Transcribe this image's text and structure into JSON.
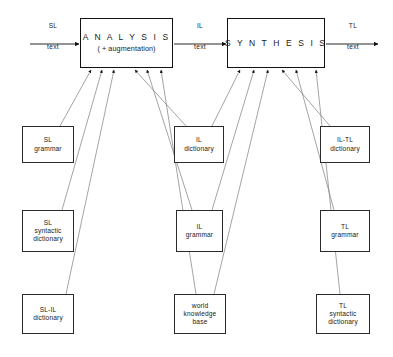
{
  "diagram": {
    "canvas": {
      "width": 393,
      "height": 357
    },
    "colors": {
      "stroke": "#2b2b2b",
      "process_stroke": "#111111",
      "background": "#ffffff",
      "text": "#1a1a1a"
    },
    "process_nodes": [
      {
        "id": "analysis",
        "line1": "A N A L Y S I S",
        "line2": "( + augmentation)",
        "x": 80,
        "y": 18,
        "w": 93,
        "h": 50
      },
      {
        "id": "synthesis",
        "line1": "S Y N T H E S I S",
        "line2": "",
        "x": 227,
        "y": 18,
        "w": 98,
        "h": 50
      }
    ],
    "flow_labels": [
      {
        "id": "sl-input",
        "top": "SL",
        "bottom": "text",
        "x": 28,
        "y": 22,
        "w": 50
      },
      {
        "id": "il-middle",
        "top": "IL",
        "bottom": "text",
        "x": 176,
        "y": 22,
        "w": 48
      },
      {
        "id": "tl-output",
        "top": "TL",
        "bottom": "text",
        "x": 330,
        "y": 22,
        "w": 46
      }
    ],
    "resource_nodes": [
      {
        "id": "sl-grammar",
        "lines": [
          "SL",
          "grammar"
        ],
        "x": 22,
        "y": 126,
        "w": 52,
        "h": 37
      },
      {
        "id": "il-dictionary",
        "lines": [
          "IL",
          "dictionary"
        ],
        "x": 174,
        "y": 126,
        "w": 50,
        "h": 37
      },
      {
        "id": "il-tl-dictionary",
        "lines": [
          "IL-TL",
          "dictionary"
        ],
        "x": 320,
        "y": 126,
        "w": 50,
        "h": 37
      },
      {
        "id": "sl-syntactic-dictionary",
        "lines": [
          "SL",
          "syntactic",
          "dictionary"
        ],
        "x": 22,
        "y": 210,
        "w": 52,
        "h": 42
      },
      {
        "id": "il-grammar",
        "lines": [
          "IL",
          "grammar"
        ],
        "x": 176,
        "y": 210,
        "w": 47,
        "h": 42
      },
      {
        "id": "tl-grammar",
        "lines": [
          "TL",
          "grammar"
        ],
        "x": 320,
        "y": 210,
        "w": 50,
        "h": 42
      },
      {
        "id": "sl-il-dictionary",
        "lines": [
          "SL-IL",
          "dictionary"
        ],
        "x": 22,
        "y": 294,
        "w": 52,
        "h": 40
      },
      {
        "id": "world-knowledge-base",
        "lines": [
          "world",
          "knowledge",
          "base"
        ],
        "x": 174,
        "y": 294,
        "w": 52,
        "h": 40
      },
      {
        "id": "tl-syntactic-dictionary",
        "lines": [
          "TL",
          "syntactic",
          "dictionary"
        ],
        "x": 316,
        "y": 294,
        "w": 54,
        "h": 40
      }
    ],
    "flow_arrows": [
      {
        "id": "sl-text-into-analysis",
        "from": [
          30,
          44
        ],
        "to": [
          79,
          44
        ]
      },
      {
        "id": "il-text-analysis-to-synthesis",
        "from": [
          174,
          44
        ],
        "to": [
          226,
          44
        ]
      },
      {
        "id": "tl-text-out-of-synthesis",
        "from": [
          326,
          44
        ],
        "to": [
          378,
          44
        ]
      }
    ],
    "resource_edges": [
      {
        "id": "sl-grammar-to-analysis",
        "from": [
          60,
          126
        ],
        "to": [
          91,
          70
        ],
        "target": "analysis"
      },
      {
        "id": "sl-syntactic-dictionary-to-analysis",
        "from": [
          62,
          210
        ],
        "to": [
          102,
          70
        ],
        "target": "analysis"
      },
      {
        "id": "sl-il-dictionary-to-analysis",
        "from": [
          66,
          294
        ],
        "to": [
          114,
          70
        ],
        "target": "analysis"
      },
      {
        "id": "il-dictionary-to-analysis",
        "from": [
          186,
          126
        ],
        "to": [
          135,
          70
        ],
        "target": "analysis"
      },
      {
        "id": "il-grammar-to-analysis",
        "from": [
          192,
          210
        ],
        "to": [
          147,
          70
        ],
        "target": "analysis"
      },
      {
        "id": "world-knowledge-base-to-analysis",
        "from": [
          196,
          294
        ],
        "to": [
          161,
          70
        ],
        "target": "analysis"
      },
      {
        "id": "il-dictionary-to-synthesis",
        "from": [
          212,
          126
        ],
        "to": [
          240,
          70
        ],
        "target": "synthesis"
      },
      {
        "id": "il-grammar-to-synthesis",
        "from": [
          212,
          210
        ],
        "to": [
          254,
          70
        ],
        "target": "synthesis"
      },
      {
        "id": "world-knowledge-base-to-synthesis",
        "from": [
          214,
          294
        ],
        "to": [
          268,
          70
        ],
        "target": "synthesis"
      },
      {
        "id": "il-tl-dictionary-to-synthesis",
        "from": [
          330,
          126
        ],
        "to": [
          282,
          70
        ],
        "target": "synthesis"
      },
      {
        "id": "tl-grammar-to-synthesis",
        "from": [
          334,
          210
        ],
        "to": [
          296,
          70
        ],
        "target": "synthesis"
      },
      {
        "id": "tl-syntactic-dictionary-to-synthesis",
        "from": [
          340,
          294
        ],
        "to": [
          316,
          70
        ],
        "target": "synthesis"
      }
    ]
  }
}
